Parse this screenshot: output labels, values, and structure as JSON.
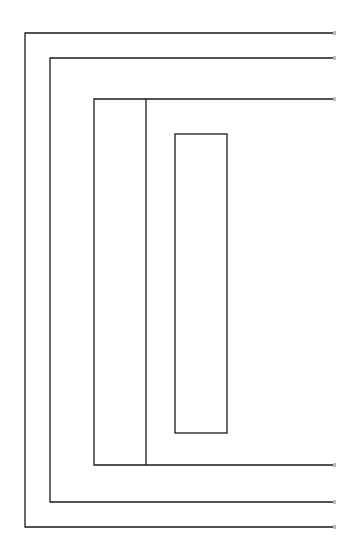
{
  "diagram": {
    "type": "nested-rectangles",
    "stroke_color": "#1a1a1a",
    "fade_color": "#bbbbbb",
    "background": "#ffffff",
    "open_right_edge_x": 333,
    "layers": [
      {
        "name": "outer-layer",
        "left": 25,
        "top": 33,
        "bottom": 527
      },
      {
        "name": "second-layer",
        "left": 50,
        "top": 58,
        "bottom": 502
      },
      {
        "name": "third-layer",
        "left": 94,
        "top": 99,
        "bottom": 465,
        "divider_x": 146
      }
    ],
    "inner_box": {
      "left": 175,
      "top": 134,
      "right": 227,
      "bottom": 433
    }
  }
}
